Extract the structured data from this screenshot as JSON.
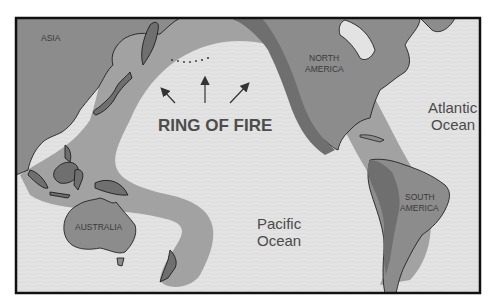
{
  "map": {
    "title_label": "RING OF FIRE",
    "continents": {
      "asia": "ASIA",
      "north_america_1": "NORTH",
      "north_america_2": "AMERICA",
      "south_america_1": "SOUTH",
      "south_america_2": "AMERICA",
      "australia": "AUSTRALIA"
    },
    "oceans": {
      "atlantic_1": "Atlantic",
      "atlantic_2": "Ocean",
      "pacific_1": "Pacific",
      "pacific_2": "Ocean"
    },
    "colors": {
      "ocean": "#e3e3e3",
      "land": "#8c8c8c",
      "ring_band": "#a2a2a2",
      "ring_on_land": "#6f6f6f",
      "border": "#111111",
      "text": "#3a3a3a"
    },
    "arrows": 3
  }
}
